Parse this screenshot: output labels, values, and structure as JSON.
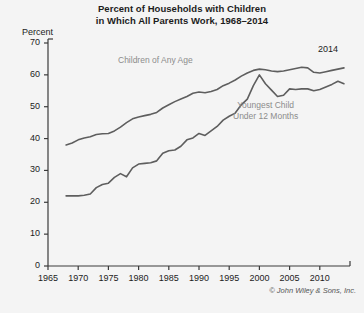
{
  "chart_data": {
    "type": "line",
    "title": "Percent of Households with Children in Which All Parents Work, 1968–2014",
    "title_line1": "Percent of Households with Children",
    "title_line2": "in Which All Parents Work, 1968–2014",
    "xlabel": "",
    "ylabel": "Percent",
    "ylim": [
      0,
      70
    ],
    "xlim": [
      1965,
      2015
    ],
    "yticks": [
      0,
      10,
      20,
      30,
      40,
      50,
      60,
      70
    ],
    "xticks": [
      1965,
      1970,
      1975,
      1980,
      1985,
      1990,
      1995,
      2000,
      2005,
      2010
    ],
    "grid": false,
    "legend_position": "inline-annotations",
    "line_color": "#5e5e5e",
    "label_color": "#8c8c8c",
    "axis_color": "#3a3a3a",
    "background": "#f4f4f4",
    "annotations": [
      {
        "name": "end-year",
        "text": "2014",
        "x": 2012,
        "y": 66
      }
    ],
    "series": [
      {
        "name": "Children of Any Age",
        "label": "Children of Any Age",
        "x": [
          1968,
          1969,
          1970,
          1971,
          1972,
          1973,
          1974,
          1975,
          1976,
          1977,
          1978,
          1979,
          1980,
          1981,
          1982,
          1983,
          1984,
          1985,
          1986,
          1987,
          1988,
          1989,
          1990,
          1991,
          1992,
          1993,
          1994,
          1995,
          1996,
          1997,
          1998,
          1999,
          2000,
          2001,
          2002,
          2003,
          2004,
          2005,
          2006,
          2007,
          2008,
          2009,
          2010,
          2011,
          2012,
          2013,
          2014
        ],
        "values": [
          38.0,
          38.6,
          39.6,
          40.2,
          40.6,
          41.3,
          41.5,
          41.6,
          42.4,
          43.6,
          45.0,
          46.2,
          46.8,
          47.2,
          47.6,
          48.2,
          49.6,
          50.6,
          51.6,
          52.4,
          53.2,
          54.2,
          54.6,
          54.4,
          54.8,
          55.4,
          56.6,
          57.4,
          58.4,
          59.6,
          60.6,
          61.4,
          61.8,
          61.6,
          61.2,
          61.0,
          61.2,
          61.6,
          62.0,
          62.4,
          62.2,
          60.8,
          60.6,
          61.0,
          61.4,
          61.8,
          62.2
        ]
      },
      {
        "name": "Youngest Child Under 12 Months",
        "label": "Youngest Child Under 12 Months",
        "label_line1": "Youngest Child",
        "label_line2": "Under 12 Months",
        "x": [
          1968,
          1969,
          1970,
          1971,
          1972,
          1973,
          1974,
          1975,
          1976,
          1977,
          1978,
          1979,
          1980,
          1981,
          1982,
          1983,
          1984,
          1985,
          1986,
          1987,
          1988,
          1989,
          1990,
          1991,
          1992,
          1993,
          1994,
          1995,
          1996,
          1997,
          1998,
          1999,
          2000,
          2001,
          2002,
          2003,
          2004,
          2005,
          2006,
          2007,
          2008,
          2009,
          2010,
          2011,
          2012,
          2013,
          2014
        ],
        "values": [
          22.0,
          22.0,
          22.0,
          22.2,
          22.6,
          24.6,
          25.6,
          26.0,
          27.8,
          29.0,
          28.0,
          30.8,
          32.0,
          32.2,
          32.4,
          33.0,
          35.4,
          36.2,
          36.4,
          37.6,
          39.6,
          40.2,
          41.6,
          41.0,
          42.4,
          43.8,
          45.8,
          47.0,
          48.0,
          50.6,
          52.4,
          56.6,
          60.0,
          57.2,
          55.2,
          53.2,
          53.6,
          55.6,
          55.4,
          55.6,
          55.6,
          55.0,
          55.4,
          56.2,
          57.0,
          58.0,
          57.2
        ]
      }
    ],
    "copyright": "© John Wiley & Sons, Inc."
  }
}
